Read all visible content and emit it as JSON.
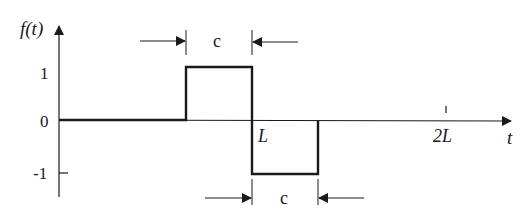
{
  "diagram": {
    "y_axis_label": "f(t)",
    "x_axis_label": "t",
    "y_ticks": [
      "1",
      "0",
      "-1"
    ],
    "x_marks": [
      "L",
      "2L"
    ],
    "width_annotation_top": "c",
    "width_annotation_bottom": "c",
    "line_color": "#1a1a1a"
  }
}
